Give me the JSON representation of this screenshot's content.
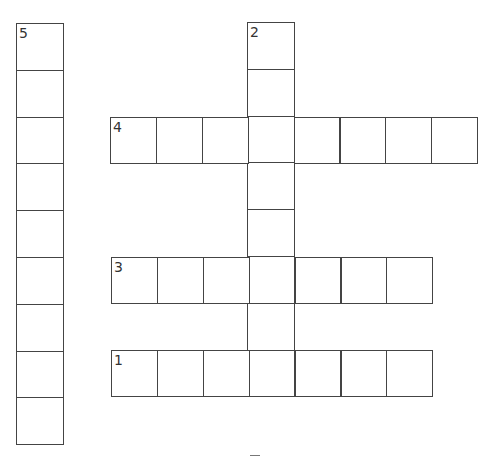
{
  "puzzle": {
    "type": "crossword",
    "cell_size": 46.6,
    "colors": {
      "line": "#444444",
      "number": "#333333",
      "background": "#ffffff"
    },
    "words": [
      {
        "number": "5",
        "direction": "down",
        "x": 16,
        "y": 23,
        "length": 9,
        "cell": 46.8
      },
      {
        "number": "2",
        "direction": "down",
        "x": 247,
        "y": 22,
        "length": 8,
        "cell": 46.8
      },
      {
        "number": "4",
        "direction": "across",
        "x": 110,
        "y": 117,
        "length": 8,
        "cell": 45.9
      },
      {
        "number": "3",
        "direction": "across",
        "x": 111,
        "y": 257,
        "length": 7,
        "cell": 45.9
      },
      {
        "number": "1",
        "direction": "across",
        "x": 111,
        "y": 350,
        "length": 7,
        "cell": 45.9
      }
    ]
  }
}
